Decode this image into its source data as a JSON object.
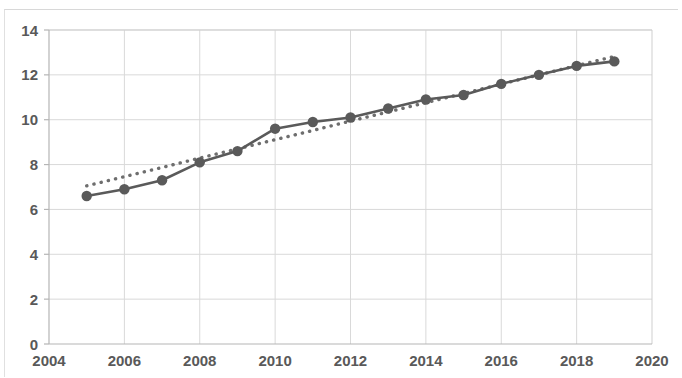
{
  "chart_data": {
    "type": "line",
    "title": "",
    "subtitle": "",
    "xlabel": "",
    "ylabel": "",
    "xlim": [
      2004,
      2020
    ],
    "ylim": [
      0,
      14
    ],
    "x_ticks": [
      2004,
      2006,
      2008,
      2010,
      2012,
      2014,
      2016,
      2018,
      2020
    ],
    "x_tick_labels": [
      "2004",
      "2006",
      "2008",
      "2010",
      "2012",
      "2014",
      "2016",
      "2018",
      "2020"
    ],
    "y_ticks": [
      0,
      2,
      4,
      6,
      8,
      10,
      12,
      14
    ],
    "y_tick_labels": [
      "0",
      "2",
      "4",
      "6",
      "8",
      "10",
      "12",
      "14"
    ],
    "grid": true,
    "grid_axis": "both",
    "legend": "none",
    "x": [
      2005,
      2006,
      2007,
      2008,
      2009,
      2010,
      2011,
      2012,
      2013,
      2014,
      2015,
      2016,
      2017,
      2018,
      2019
    ],
    "series": [
      {
        "name": "data",
        "style": "solid-line-with-round-markers",
        "color": "#5a5a5a",
        "marker": "circle",
        "values": [
          6.6,
          6.9,
          7.3,
          8.1,
          8.6,
          9.6,
          9.9,
          10.1,
          10.5,
          10.9,
          11.1,
          11.6,
          12.0,
          12.4,
          12.6
        ]
      },
      {
        "name": "trendline",
        "style": "dotted",
        "color": "#6e6e6e",
        "marker": "none",
        "values": [
          7.05,
          7.46,
          7.87,
          8.29,
          8.7,
          9.11,
          9.52,
          9.94,
          10.35,
          10.76,
          11.17,
          11.59,
          12.0,
          12.41,
          12.82
        ]
      }
    ],
    "colors": {
      "series_line": "#5a5a5a",
      "trendline": "#6e6e6e",
      "grid": "#d9d9d9",
      "axis": "#bfbfbf",
      "tick_text": "#595959",
      "background": "#ffffff"
    }
  }
}
